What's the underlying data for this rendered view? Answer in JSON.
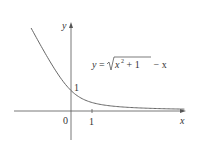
{
  "chart_data": {
    "type": "line",
    "title": "",
    "equation": "y = √(x² + 1) − x",
    "equation_parts": {
      "lhs": "y",
      "eq": "=",
      "radicand_base": "x",
      "exponent": "2",
      "radicand_rest": " + 1",
      "tail": " − x"
    },
    "xlabel": "x",
    "ylabel": "y",
    "x_ticks": [
      {
        "value": 0,
        "label": "0"
      },
      {
        "value": 1,
        "label": "1"
      }
    ],
    "y_ticks": [
      {
        "value": 1,
        "label": "1"
      }
    ],
    "xlim": [
      -2.7,
      5.4
    ],
    "ylim": [
      -1.4,
      4.2
    ],
    "grid": false,
    "legend": "none",
    "series": [
      {
        "name": "y = sqrt(x^2+1) - x",
        "x": [
          -1.9,
          -1.5,
          -1.0,
          -0.5,
          0,
          0.5,
          1.0,
          1.5,
          2.0,
          3.0,
          4.0,
          5.4
        ],
        "y": [
          4.05,
          3.3,
          2.41,
          1.62,
          1.0,
          0.62,
          0.41,
          0.3,
          0.24,
          0.16,
          0.12,
          0.09
        ]
      }
    ]
  },
  "labels": {
    "origin": "0",
    "x_tick_1": "1",
    "y_tick_1": "1",
    "x_axis": "x",
    "y_axis": "y"
  }
}
